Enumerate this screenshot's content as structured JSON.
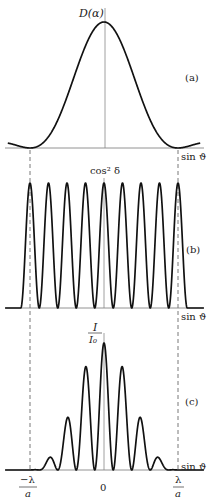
{
  "figure": {
    "panels": [
      {
        "id": "a",
        "panel_label": "(a)",
        "y_label": "D(α)",
        "x_label": "sin ϑ",
        "description": "single-slit diffraction envelope"
      },
      {
        "id": "b",
        "panel_label": "(b)",
        "y_label": "cos² δ",
        "x_label": "sin ϑ",
        "description": "two-source interference fringes"
      },
      {
        "id": "c",
        "panel_label": "(c)",
        "y_label_num": "I",
        "y_label_den": "I₀",
        "x_label": "sin ϑ",
        "description": "product: interference modulated by diffraction envelope"
      }
    ],
    "x_ticks": {
      "left_num": "−λ",
      "left_den": "a",
      "center": "0",
      "right_num": "λ",
      "right_den": "a"
    }
  },
  "chart_data": [
    {
      "type": "line",
      "panel": "a",
      "title": "(a)",
      "ylabel": "D(α)",
      "xlabel": "sin ϑ",
      "x": [
        -1.15,
        -1.0,
        -0.75,
        -0.5,
        -0.25,
        0,
        0.25,
        0.5,
        0.75,
        1.0,
        1.15
      ],
      "values": [
        0.06,
        0.0,
        0.16,
        0.52,
        0.88,
        1.0,
        0.88,
        0.52,
        0.16,
        0.0,
        0.06
      ],
      "xlim": [
        -1.15,
        1.15
      ],
      "ylim": [
        0,
        1
      ],
      "grid": false
    },
    {
      "type": "line",
      "panel": "b",
      "title": "(b)",
      "ylabel": "cos² δ",
      "xlabel": "sin ϑ",
      "peaks_x": [
        -1.0,
        -0.75,
        -0.5,
        -0.25,
        0,
        0.25,
        0.5,
        0.75,
        1.0
      ],
      "peak_values": [
        1,
        1,
        1,
        1,
        1,
        1,
        1,
        1,
        1
      ],
      "fringe_count": 9,
      "xlim": [
        -1.15,
        1.15
      ],
      "ylim": [
        0,
        1
      ],
      "grid": false
    },
    {
      "type": "line",
      "panel": "c",
      "title": "(c)",
      "ylabel": "I/I₀",
      "xlabel": "sin ϑ",
      "peaks_x": [
        -0.75,
        -0.5,
        -0.25,
        0,
        0.25,
        0.5,
        0.75
      ],
      "peak_values": [
        0.09,
        0.39,
        0.79,
        1.0,
        0.79,
        0.39,
        0.09
      ],
      "xlim": [
        -1.15,
        1.15
      ],
      "ylim": [
        0,
        1
      ],
      "x_tick_labels": [
        "−λ/a",
        "0",
        "λ/a"
      ],
      "grid": false
    }
  ]
}
